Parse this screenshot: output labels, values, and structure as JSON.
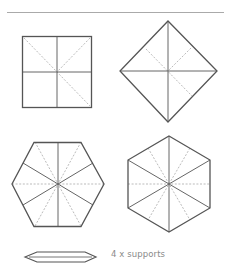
{
  "colors": {
    "outline": "#555555",
    "fold_line": "#999999",
    "rule": "#aaaaaa",
    "text": "#8a8a8a"
  },
  "shapes": [
    {
      "name": "square",
      "folds": "solid cross + dashed diagonals"
    },
    {
      "name": "diamond",
      "folds": "solid cross + dashed diagonals"
    },
    {
      "name": "hexagon-flat-top",
      "folds": "solid spokes + dashed bisectors"
    },
    {
      "name": "hexagon-pointy-top",
      "folds": "solid spokes + dashed bisectors"
    }
  ],
  "supports": {
    "label": "4 x supports"
  }
}
